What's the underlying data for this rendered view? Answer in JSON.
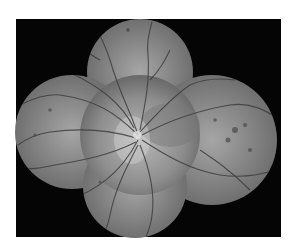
{
  "image": {
    "subject": "retinal-fundus-montage",
    "mode": "grayscale",
    "background_color": "#ffffff",
    "frame_color": "#050505",
    "fundus_fields": 5
  }
}
